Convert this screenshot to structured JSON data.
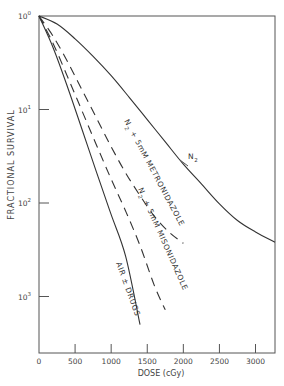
{
  "chart_data": {
    "type": "line",
    "title": "",
    "xlabel": "DOSE (cGy)",
    "ylabel": "FRACTIONAL SURVIVAL",
    "xlim": [
      0,
      3270
    ],
    "ylim": [
      0.0003,
      1
    ],
    "yscale": "log",
    "grid": false,
    "x_ticks": [
      0,
      500,
      1000,
      1500,
      2000,
      2500,
      3000
    ],
    "x_tick_labels": [
      "0",
      "500",
      "1000",
      "1500",
      "2000",
      "2500",
      "3000"
    ],
    "y_ticks": [
      1,
      0.1,
      0.01,
      0.001
    ],
    "y_tick_labels": [
      {
        "base": "10",
        "exp": "0"
      },
      {
        "base": "10",
        "exp": "-1"
      },
      {
        "base": "10",
        "exp": "-2"
      },
      {
        "base": "10",
        "exp": "-3"
      }
    ],
    "series": [
      {
        "name": "N2",
        "label_main": "N",
        "label_sub": "2",
        "style": "solid",
        "x": [
          0,
          250,
          500,
          750,
          1000,
          1250,
          1500,
          1750,
          2000,
          2250,
          2500,
          2750,
          3000,
          3270
        ],
        "y": [
          1,
          0.82,
          0.57,
          0.37,
          0.23,
          0.135,
          0.078,
          0.045,
          0.026,
          0.016,
          0.0098,
          0.0065,
          0.0049,
          0.0038
        ]
      },
      {
        "name": "N2 + 5mM METRONIDAZOLE",
        "label_main": "N",
        "label_sub": "2",
        "label_rest": " + 5mM  METRONIDAZOLE",
        "style": "dashed",
        "x": [
          0,
          200,
          400,
          600,
          800,
          1000,
          1200,
          1400,
          1600,
          1800,
          2000
        ],
        "y": [
          1,
          0.6,
          0.32,
          0.16,
          0.08,
          0.04,
          0.021,
          0.012,
          0.0072,
          0.0049,
          0.0037
        ]
      },
      {
        "name": "N2 + 5mM MISONIDAZOLE",
        "label_main": "N",
        "label_sub": "2",
        "label_rest": " + 5mM  MISONIDAZOLE",
        "style": "dashed",
        "x": [
          0,
          200,
          400,
          600,
          800,
          1000,
          1200,
          1400,
          1600,
          1750
        ],
        "y": [
          1,
          0.5,
          0.22,
          0.095,
          0.041,
          0.018,
          0.0082,
          0.0035,
          0.0013,
          0.00072
        ]
      },
      {
        "name": "AIR ± DRUGS",
        "label_main": "AIR ± DRUGS",
        "style": "solid",
        "x": [
          0,
          200,
          400,
          600,
          800,
          1000,
          1200,
          1400
        ],
        "y": [
          1,
          0.45,
          0.17,
          0.06,
          0.021,
          0.0075,
          0.0027,
          0.0005
        ]
      }
    ]
  }
}
